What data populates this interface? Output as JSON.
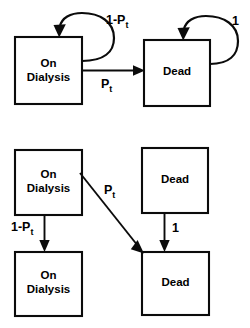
{
  "figure": {
    "type": "state-transition-diagram",
    "background_color": "#ffffff",
    "line_color": "#0b0b0b",
    "text_color": "#000000"
  },
  "panels": [
    {
      "id": "top-panel",
      "name": "markov-state-transition-panel",
      "nodes": [
        {
          "id": "top-on-dialysis",
          "label_line1": "On",
          "label_line2": "Dialysis"
        },
        {
          "id": "top-dead",
          "label_line1": "Dead",
          "label_line2": ""
        }
      ],
      "edges": [
        {
          "id": "top-self-loop-on-dialysis",
          "from": "top-on-dialysis",
          "to": "top-on-dialysis",
          "label_base": "1-P",
          "label_sub": "t",
          "kind": "self-loop"
        },
        {
          "id": "top-self-loop-dead",
          "from": "top-dead",
          "to": "top-dead",
          "label_base": "1",
          "label_sub": "",
          "kind": "self-loop"
        },
        {
          "id": "top-on-dialysis-to-dead",
          "from": "top-on-dialysis",
          "to": "top-dead",
          "label_base": "P",
          "label_sub": "t",
          "kind": "horizontal"
        }
      ]
    },
    {
      "id": "bottom-panel",
      "name": "decision-tree-panel",
      "nodes": [
        {
          "id": "mid-on-dialysis",
          "label_line1": "On",
          "label_line2": "Dialysis"
        },
        {
          "id": "mid-dead",
          "label_line1": "Dead",
          "label_line2": ""
        },
        {
          "id": "bot-on-dialysis",
          "label_line1": "On",
          "label_line2": "Dialysis"
        },
        {
          "id": "bot-dead",
          "label_line1": "Dead",
          "label_line2": ""
        }
      ],
      "edges": [
        {
          "id": "mid-on-dialysis-to-bot-on-dialysis",
          "from": "mid-on-dialysis",
          "to": "bot-on-dialysis",
          "label_base": "1-P",
          "label_sub": "t",
          "kind": "vertical"
        },
        {
          "id": "mid-on-dialysis-to-bot-dead",
          "from": "mid-on-dialysis",
          "to": "bot-dead",
          "label_base": "P",
          "label_sub": "t",
          "kind": "diagonal"
        },
        {
          "id": "mid-dead-to-bot-dead",
          "from": "mid-dead",
          "to": "bot-dead",
          "label_base": "1",
          "label_sub": "",
          "kind": "vertical"
        }
      ]
    }
  ],
  "labels": {
    "on_dialysis_line1": "On",
    "on_dialysis_line2": "Dialysis",
    "dead": "Dead",
    "one_minus_pt_base": "1-P",
    "one_minus_pt_sub": "t",
    "pt_base": "P",
    "pt_sub": "t",
    "one": "1"
  }
}
